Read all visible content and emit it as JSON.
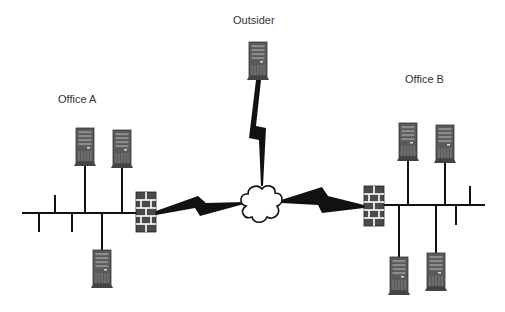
{
  "diagram": {
    "type": "network",
    "labels": {
      "office_a": "Office A",
      "office_b": "Office B",
      "outsider": "Outsider"
    },
    "nodes": [
      {
        "id": "outsider-server",
        "kind": "server",
        "group": "Outsider"
      },
      {
        "id": "internet-cloud",
        "kind": "cloud"
      },
      {
        "id": "firewall-a",
        "kind": "firewall",
        "group": "Office A"
      },
      {
        "id": "firewall-b",
        "kind": "firewall",
        "group": "Office B"
      },
      {
        "id": "office-a-server-1",
        "kind": "server",
        "group": "Office A"
      },
      {
        "id": "office-a-server-2",
        "kind": "server",
        "group": "Office A"
      },
      {
        "id": "office-a-server-3",
        "kind": "server",
        "group": "Office A"
      },
      {
        "id": "office-b-server-1",
        "kind": "server",
        "group": "Office B"
      },
      {
        "id": "office-b-server-2",
        "kind": "server",
        "group": "Office B"
      },
      {
        "id": "office-b-server-3",
        "kind": "server",
        "group": "Office B"
      },
      {
        "id": "office-b-server-4",
        "kind": "server",
        "group": "Office B"
      }
    ],
    "links": [
      {
        "from": "outsider-server",
        "to": "internet-cloud",
        "kind": "wan-lightning"
      },
      {
        "from": "firewall-a",
        "to": "internet-cloud",
        "kind": "wan-lightning"
      },
      {
        "from": "internet-cloud",
        "to": "firewall-b",
        "kind": "wan-lightning"
      },
      {
        "from": "firewall-a",
        "to": "office-a-bus",
        "kind": "lan"
      },
      {
        "from": "firewall-b",
        "to": "office-b-bus",
        "kind": "lan"
      }
    ],
    "colors": {
      "line": "#111111",
      "server_body": "#555555",
      "firewall_brick": "#555555",
      "mortar": "#ffffff"
    }
  }
}
